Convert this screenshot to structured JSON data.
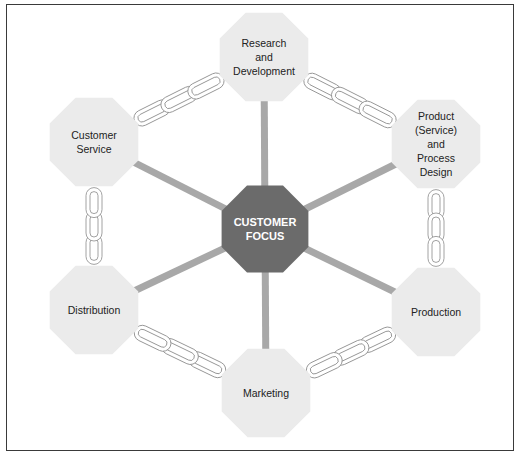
{
  "diagram": {
    "center": {
      "label": "CUSTOMER\nFOCUS",
      "x": 265,
      "y": 229,
      "r": 47,
      "fill": "#6b6b6b"
    },
    "nodes": [
      {
        "id": "rnd",
        "label": "Research\nand\nDevelopment",
        "x": 264,
        "y": 57,
        "r": 48
      },
      {
        "id": "product",
        "label": "Product\n(Service)\nand\nProcess\nDesign",
        "x": 436,
        "y": 144,
        "r": 48
      },
      {
        "id": "production",
        "label": "Production",
        "x": 436,
        "y": 312,
        "r": 48
      },
      {
        "id": "marketing",
        "label": "Marketing",
        "x": 266,
        "y": 393,
        "r": 48
      },
      {
        "id": "distribution",
        "label": "Distribution",
        "x": 94,
        "y": 310,
        "r": 48
      },
      {
        "id": "customer-service",
        "label": "Customer\nService",
        "x": 94,
        "y": 142,
        "r": 48
      }
    ],
    "colors": {
      "node_fill": "#ebebeb",
      "spoke": "#a8a8a8",
      "chain": "#8a8a8a",
      "frame": "#3a3a3a"
    },
    "chains": [
      {
        "from": "rnd",
        "to": "product"
      },
      {
        "from": "product",
        "to": "production"
      },
      {
        "from": "production",
        "to": "marketing"
      },
      {
        "from": "marketing",
        "to": "distribution"
      },
      {
        "from": "distribution",
        "to": "customer-service"
      },
      {
        "from": "customer-service",
        "to": "rnd"
      }
    ]
  }
}
